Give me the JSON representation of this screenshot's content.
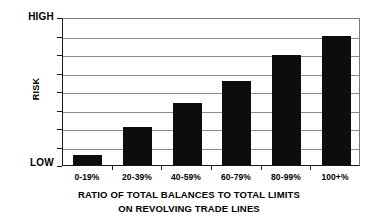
{
  "chart_data": {
    "type": "bar",
    "title": "",
    "subtitle": "",
    "categories": [
      "0-19%",
      "20-39%",
      "40-59%",
      "60-79%",
      "80-99%",
      "100+%"
    ],
    "values": [
      0.55,
      2.05,
      3.35,
      4.55,
      5.95,
      6.95
    ],
    "xlabel": "RATIO OF TOTAL BALANCES TO TOTAL LIMITS",
    "xlabel_line2": "ON REVOLVING TRADE LINES",
    "ylabel": "RISK",
    "ylim": [
      0,
      8
    ],
    "y_axis_low_label": "LOW",
    "y_axis_high_label": "HIGH",
    "y_tick_count": 9,
    "gridlines": true,
    "grid_interval": 1,
    "legend": null,
    "legend_position": "none",
    "bar_color": "#0d0d0d",
    "grid_color": "#8c8c8c",
    "axis_color": "#1a1a1a",
    "background_color": "#ffffff"
  }
}
